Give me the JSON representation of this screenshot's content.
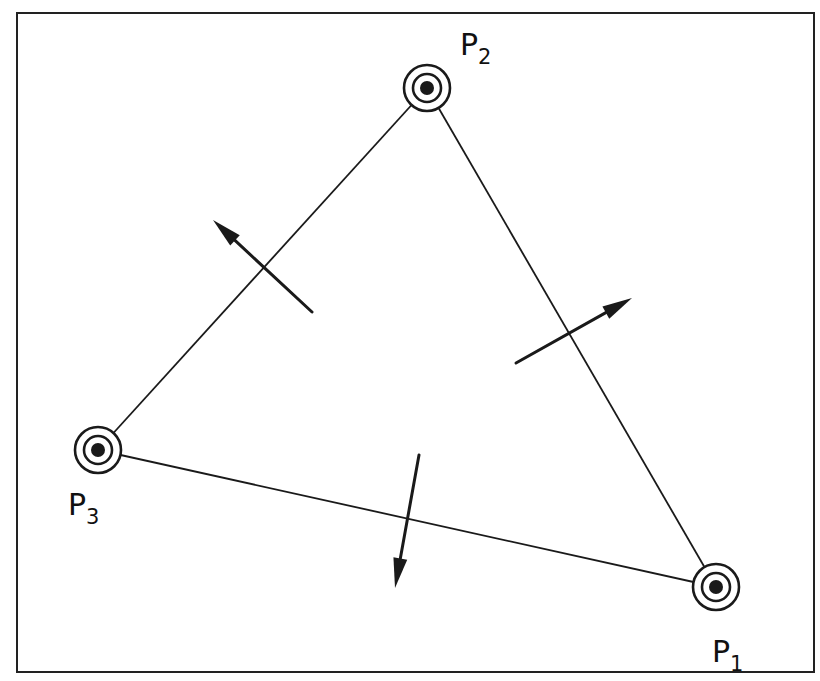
{
  "diagram": {
    "frame": {
      "x": 17,
      "y": 13,
      "width": 797,
      "height": 659,
      "stroke": "#222222"
    },
    "points": [
      {
        "id": "P1",
        "label": "P",
        "subscript": "1",
        "x": 716,
        "y": 587,
        "label_x": 712,
        "label_y": 662
      },
      {
        "id": "P2",
        "label": "P",
        "subscript": "2",
        "x": 427,
        "y": 88,
        "label_x": 460,
        "label_y": 55
      },
      {
        "id": "P3",
        "label": "P",
        "subscript": "3",
        "x": 98,
        "y": 450,
        "label_x": 68,
        "label_y": 515
      }
    ],
    "edges": [
      {
        "from": "P2",
        "to": "P1"
      },
      {
        "from": "P3",
        "to": "P2"
      },
      {
        "from": "P3",
        "to": "P1"
      }
    ],
    "normal_arrows": [
      {
        "edge": "P3-P2",
        "tail_x": 312,
        "tail_y": 312,
        "head_x": 213,
        "head_y": 220
      },
      {
        "edge": "P2-P1",
        "tail_x": 516,
        "tail_y": 363,
        "head_x": 632,
        "head_y": 298
      },
      {
        "edge": "P3-P1",
        "tail_x": 419,
        "tail_y": 455,
        "head_x": 395,
        "head_y": 588
      }
    ],
    "colors": {
      "line": "#1a1a1a",
      "background": "#ffffff"
    }
  }
}
